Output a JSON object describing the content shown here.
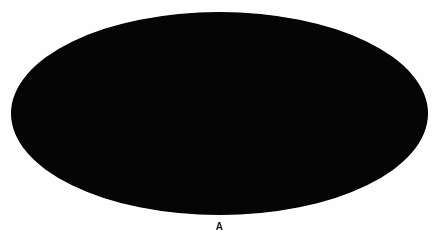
{
  "figure": {
    "panel_label": "A",
    "caption_position": "below",
    "background_color": "#fefefe"
  },
  "skymap": {
    "name": "all-sky-projection-map",
    "projection": "Mollweide (Aitoff) full-sky ellipse",
    "bounds_px": {
      "x": 11,
      "y": 12,
      "width": 417,
      "height": 203
    },
    "base_color": "#030303",
    "structure_color": "#b9b9b9",
    "highlight_color": "#ffffff",
    "rim_shadow_color": "#000000",
    "description": "Dark full-sky ellipse showing a faint granular filamentary cosmic-web / galaxy distribution with brighter knots and a faint vertical seam near the meridian",
    "seam": {
      "x_fraction": 0.505,
      "visible": true
    },
    "render": {
      "grain_points": 26000,
      "filament_count": 54,
      "knot_count": 26,
      "vignette": true
    }
  },
  "chart_data": {
    "type": "heatmap",
    "title": "A",
    "subtitle": "",
    "xlabel": "",
    "ylabel": "",
    "projection": "mollweide",
    "legend_position": "none",
    "grid": false,
    "colormap": [
      "#000000",
      "#2a2a2a",
      "#7a7a7a",
      "#e8e8e8",
      "#ffffff"
    ],
    "value_label": "surface density",
    "xlim": [
      -180,
      180
    ],
    "ylim": [
      -90,
      90
    ],
    "annotations": [
      {
        "text": "A",
        "x": 0,
        "y": -104,
        "role": "panel-label"
      }
    ],
    "filaments": [
      {
        "name": "left-bright-ridge",
        "x": -118,
        "y": 6,
        "length": 62,
        "angle": 8,
        "intensity": 0.82
      },
      {
        "name": "left-lower-arc",
        "x": -128,
        "y": -16,
        "length": 48,
        "angle": -14,
        "intensity": 0.7
      },
      {
        "name": "upper-left-strand",
        "x": -74,
        "y": 34,
        "length": 54,
        "angle": -22,
        "intensity": 0.58
      },
      {
        "name": "mid-upper-web",
        "x": -30,
        "y": 40,
        "length": 70,
        "angle": 12,
        "intensity": 0.5
      },
      {
        "name": "central-seam-strand",
        "x": 2,
        "y": 18,
        "length": 86,
        "angle": 86,
        "intensity": 0.46
      },
      {
        "name": "central-knot-spur",
        "x": 18,
        "y": -8,
        "length": 40,
        "angle": 58,
        "intensity": 0.88
      },
      {
        "name": "lower-central-arc",
        "x": -16,
        "y": -26,
        "length": 66,
        "angle": -6,
        "intensity": 0.64
      },
      {
        "name": "right-upper-band",
        "x": 78,
        "y": 26,
        "length": 72,
        "angle": -10,
        "intensity": 0.52
      },
      {
        "name": "right-vertical-streak",
        "x": 126,
        "y": 10,
        "length": 50,
        "angle": 80,
        "intensity": 0.66
      },
      {
        "name": "right-lower-web",
        "x": 96,
        "y": -34,
        "length": 64,
        "angle": 16,
        "intensity": 0.48
      },
      {
        "name": "far-right-rim-glow",
        "x": 156,
        "y": -2,
        "length": 36,
        "angle": -30,
        "intensity": 0.6
      },
      {
        "name": "bottom-band",
        "x": 10,
        "y": -56,
        "length": 110,
        "angle": 4,
        "intensity": 0.44
      }
    ],
    "knots": [
      {
        "name": "central-bright-cluster",
        "x": 20,
        "y": -10,
        "radius": 7,
        "intensity": 1.0
      },
      {
        "name": "left-cluster",
        "x": -112,
        "y": 8,
        "radius": 6,
        "intensity": 0.92
      },
      {
        "name": "left-edge-cluster",
        "x": -150,
        "y": -6,
        "radius": 5,
        "intensity": 0.78
      },
      {
        "name": "upper-mid-cluster",
        "x": -46,
        "y": 44,
        "radius": 4,
        "intensity": 0.7
      },
      {
        "name": "right-streak-cluster",
        "x": 124,
        "y": 14,
        "radius": 5,
        "intensity": 0.8
      },
      {
        "name": "lower-right-cluster",
        "x": 84,
        "y": -42,
        "radius": 4,
        "intensity": 0.62
      },
      {
        "name": "upper-right-cluster",
        "x": 92,
        "y": 36,
        "radius": 4,
        "intensity": 0.58
      }
    ]
  }
}
